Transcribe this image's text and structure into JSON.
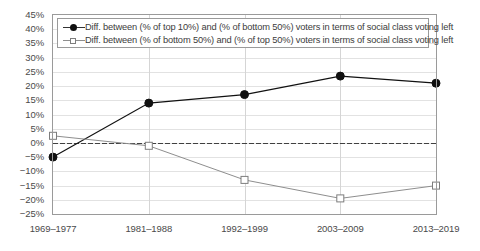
{
  "chart_data": {
    "type": "line",
    "title": "",
    "subtitle": "",
    "xlabel": "",
    "ylabel": "",
    "categories": [
      "1969–1977",
      "1981–1988",
      "1992–1999",
      "2003–2009",
      "2013–2019"
    ],
    "ylim": [
      -25,
      45
    ],
    "ytick_step": 5,
    "ytick_labels": [
      "45%",
      "40%",
      "35%",
      "30%",
      "25%",
      "20%",
      "15%",
      "10%",
      "5%",
      "0%",
      "−5%",
      "−10%",
      "−15%",
      "−20%",
      "−25%"
    ],
    "ytick_values": [
      45,
      40,
      35,
      30,
      25,
      20,
      15,
      10,
      5,
      0,
      -5,
      -10,
      -15,
      -20,
      -25
    ],
    "grid": "horizontal-and-vertical",
    "zero_line": true,
    "legend_position": "top-inside",
    "series": [
      {
        "name": "Diff. between (% of top 10%) and (% of bottom 50%) voters in terms of social class voting left",
        "marker": "filled-circle",
        "color": "#111111",
        "values": [
          -5.0,
          14.0,
          17.0,
          23.5,
          21.0
        ]
      },
      {
        "name": "Diff. between (% of bottom 50%) and (% of top 50%) voters in terms of social class voting left",
        "marker": "hollow-square",
        "color": "#8e8e8e",
        "values": [
          2.5,
          -1.0,
          -13.0,
          -19.5,
          -15.0
        ]
      }
    ]
  },
  "legend": {
    "entries": [
      {
        "label": "Diff. between (% of top 10%) and (% of bottom 50%) voters in terms of social class voting left"
      },
      {
        "label": "Diff. between (% of bottom 50%) and (% of top 50%) voters in terms of social class voting left"
      }
    ]
  }
}
